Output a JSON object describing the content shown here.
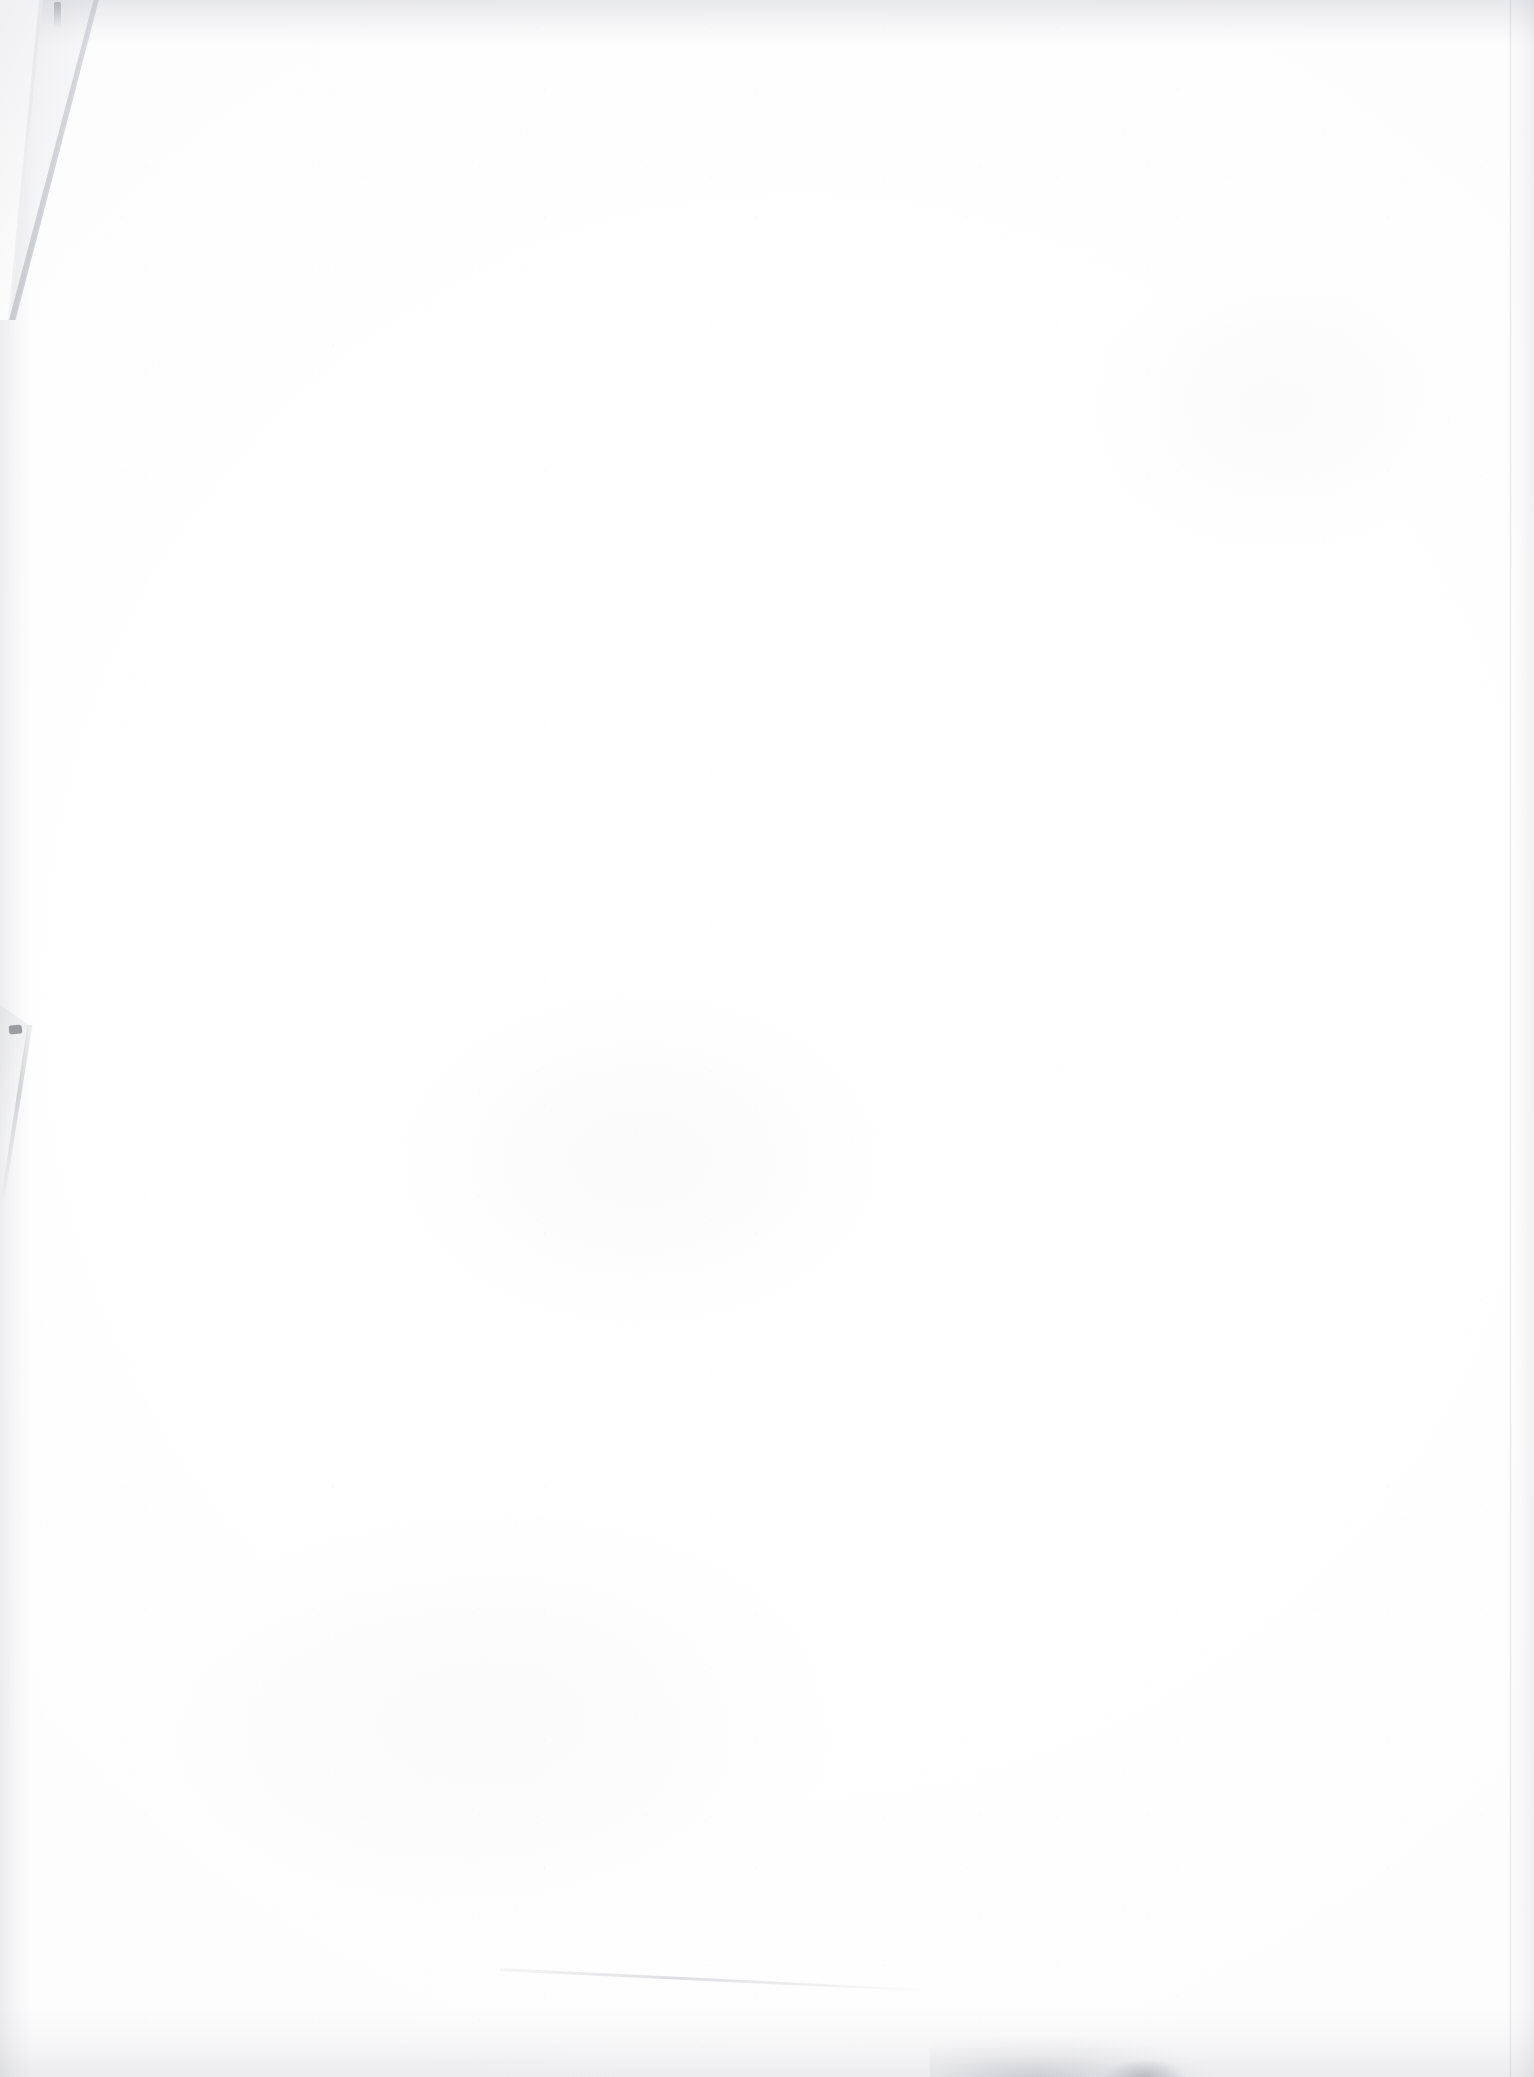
{
  "document": {
    "kind": "scanned-page",
    "page_state_label": "Blank page",
    "body_text": "",
    "header_text": "",
    "footer_text": "",
    "page_number_text": ""
  },
  "canvas": {
    "width_px": 1534,
    "height_px": 2077
  },
  "colors": {
    "background": "#ffffff",
    "paper": "#ffffff",
    "paper_tint": "#fbfbfc",
    "edge_shadow": "#787a82",
    "fold_face": "#f0f0f2",
    "tear_mark": "#696b73",
    "crease_line": "#9698a0"
  },
  "artifacts": [
    {
      "id": "torn-corner-top-left",
      "label": "Torn folded corner (top-left)",
      "x": 0,
      "y": 0,
      "width": 130,
      "height": 320
    },
    {
      "id": "tear-notch-left",
      "label": "Small tear notch on left edge",
      "x": 0,
      "y": 1005,
      "width": 120,
      "height": 200
    },
    {
      "id": "crease-lower",
      "label": "Faint diagonal crease near bottom",
      "x": 500,
      "y": 1952,
      "width": 420,
      "height": 40
    },
    {
      "id": "smudge-bottom",
      "label": "Scan smudge along bottom edge",
      "x": 930,
      "y": 2035,
      "width": 300,
      "height": 42
    },
    {
      "id": "edge-shadow-top",
      "label": "Scanner shadow band along top edge",
      "x": 0,
      "y": 0,
      "width": 1534,
      "height": 46
    },
    {
      "id": "edge-shadow-left",
      "label": "Scanner shadow band along left edge",
      "x": 0,
      "y": 0,
      "width": 34,
      "height": 2077
    },
    {
      "id": "edge-shadow-right",
      "label": "Scanner shadow band along right edge",
      "x": 1506,
      "y": 0,
      "width": 28,
      "height": 2077
    },
    {
      "id": "edge-shadow-bottom",
      "label": "Scanner shadow band along bottom edge",
      "x": 0,
      "y": 2007,
      "width": 1534,
      "height": 70
    },
    {
      "id": "sheet-right-border",
      "label": "Faint sheet boundary line near right margin",
      "x": 1509,
      "y": 0,
      "width": 3,
      "height": 2077
    }
  ]
}
